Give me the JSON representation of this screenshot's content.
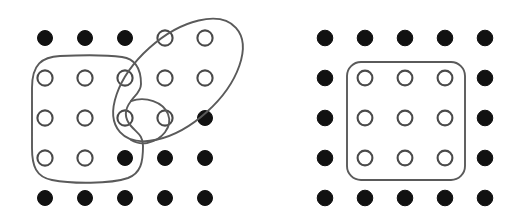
{
  "figure": {
    "title": "",
    "background_color": "#ffffff",
    "panels": [
      {
        "id": "left-panel",
        "name": "irregular-clusters-panel",
        "grid": {
          "rows": 5,
          "cols": 5,
          "x_positions": [
            45,
            85,
            125,
            165,
            205
          ],
          "y_positions": [
            38,
            78,
            118,
            158,
            198
          ],
          "filled_radius": 7.5,
          "open_radius": 7.6
        },
        "nodes": [
          {
            "row": 0,
            "col": 0,
            "state": "filled"
          },
          {
            "row": 0,
            "col": 1,
            "state": "filled"
          },
          {
            "row": 0,
            "col": 2,
            "state": "filled"
          },
          {
            "row": 0,
            "col": 3,
            "state": "open"
          },
          {
            "row": 0,
            "col": 4,
            "state": "open"
          },
          {
            "row": 1,
            "col": 0,
            "state": "open"
          },
          {
            "row": 1,
            "col": 1,
            "state": "open"
          },
          {
            "row": 1,
            "col": 2,
            "state": "open"
          },
          {
            "row": 1,
            "col": 3,
            "state": "open"
          },
          {
            "row": 1,
            "col": 4,
            "state": "open"
          },
          {
            "row": 2,
            "col": 0,
            "state": "open"
          },
          {
            "row": 2,
            "col": 1,
            "state": "open"
          },
          {
            "row": 2,
            "col": 2,
            "state": "open"
          },
          {
            "row": 2,
            "col": 3,
            "state": "open"
          },
          {
            "row": 2,
            "col": 4,
            "state": "filled"
          },
          {
            "row": 3,
            "col": 0,
            "state": "open"
          },
          {
            "row": 3,
            "col": 1,
            "state": "open"
          },
          {
            "row": 3,
            "col": 2,
            "state": "filled"
          },
          {
            "row": 3,
            "col": 3,
            "state": "filled"
          },
          {
            "row": 3,
            "col": 4,
            "state": "filled"
          },
          {
            "row": 4,
            "col": 0,
            "state": "filled"
          },
          {
            "row": 4,
            "col": 1,
            "state": "filled"
          },
          {
            "row": 4,
            "col": 2,
            "state": "filled"
          },
          {
            "row": 4,
            "col": 3,
            "state": "filled"
          },
          {
            "row": 4,
            "col": 4,
            "state": "filled"
          }
        ],
        "outlines": [
          {
            "id": "blob-rounded-left",
            "name": "cluster-outline-blob",
            "shape": "closed-freeform-blob",
            "encloses_note": "columns 1-2 rows 2-4 plus protrusion to column 3 row 3",
            "path": "M 32 88 C 32 64 42 57 60 56 C 82 55 108 55 122 57 C 136 59 141 70 141 84 C 141 92 134 96 131 101 C 124 110 124 118 131 126 C 137 133 143 135 143 146 C 143 162 141 173 128 178 C 110 184 72 184 52 180 C 36 177 32 166 32 148 Z"
          },
          {
            "id": "lobe-protrusion",
            "name": "cluster-outline-protrusion",
            "shape": "lobe",
            "encloses_note": "column 3 row 3 node attached to left blob",
            "path": "M 131 101 C 146 96 163 102 168 114 C 173 127 162 140 147 143 C 141 144 136 143 131 140"
          },
          {
            "id": "ellipse-tilted",
            "name": "cluster-outline-ellipse",
            "shape": "rotated-ellipse",
            "encloses_note": "columns 3-5 rows 1-2 and columns 3-4 row 3",
            "cx": 178,
            "cy": 80,
            "rx": 78,
            "ry": 43,
            "rotation_deg": -42
          }
        ]
      },
      {
        "id": "right-panel",
        "name": "regular-cluster-panel",
        "grid": {
          "rows": 5,
          "cols": 5,
          "x_positions": [
            325,
            365,
            405,
            445,
            485
          ],
          "y_positions": [
            38,
            78,
            118,
            158,
            198
          ],
          "filled_radius": 7.8,
          "open_radius": 7.4
        },
        "nodes": [
          {
            "row": 0,
            "col": 0,
            "state": "filled"
          },
          {
            "row": 0,
            "col": 1,
            "state": "filled"
          },
          {
            "row": 0,
            "col": 2,
            "state": "filled"
          },
          {
            "row": 0,
            "col": 3,
            "state": "filled"
          },
          {
            "row": 0,
            "col": 4,
            "state": "filled"
          },
          {
            "row": 1,
            "col": 0,
            "state": "filled"
          },
          {
            "row": 1,
            "col": 1,
            "state": "open"
          },
          {
            "row": 1,
            "col": 2,
            "state": "open"
          },
          {
            "row": 1,
            "col": 3,
            "state": "open"
          },
          {
            "row": 1,
            "col": 4,
            "state": "filled"
          },
          {
            "row": 2,
            "col": 0,
            "state": "filled"
          },
          {
            "row": 2,
            "col": 1,
            "state": "open"
          },
          {
            "row": 2,
            "col": 2,
            "state": "open"
          },
          {
            "row": 2,
            "col": 3,
            "state": "open"
          },
          {
            "row": 2,
            "col": 4,
            "state": "filled"
          },
          {
            "row": 3,
            "col": 0,
            "state": "filled"
          },
          {
            "row": 3,
            "col": 1,
            "state": "open"
          },
          {
            "row": 3,
            "col": 2,
            "state": "open"
          },
          {
            "row": 3,
            "col": 3,
            "state": "open"
          },
          {
            "row": 3,
            "col": 4,
            "state": "filled"
          },
          {
            "row": 4,
            "col": 0,
            "state": "filled"
          },
          {
            "row": 4,
            "col": 1,
            "state": "filled"
          },
          {
            "row": 4,
            "col": 2,
            "state": "filled"
          },
          {
            "row": 4,
            "col": 3,
            "state": "filled"
          },
          {
            "row": 4,
            "col": 4,
            "state": "filled"
          }
        ],
        "outlines": [
          {
            "id": "rounded-rectangle",
            "name": "cluster-outline-rounded-rect",
            "shape": "rounded-rectangle",
            "encloses_note": "inner 3x3 block of open nodes",
            "x": 347,
            "y": 62,
            "width": 118,
            "height": 118,
            "corner_radius": 14
          }
        ]
      }
    ],
    "colors": {
      "filled_node": "#111111",
      "open_node_stroke": "#4a4a4a",
      "open_node_fill": "#ffffff",
      "outline_stroke": "#5a5a5a",
      "background": "#ffffff"
    }
  }
}
